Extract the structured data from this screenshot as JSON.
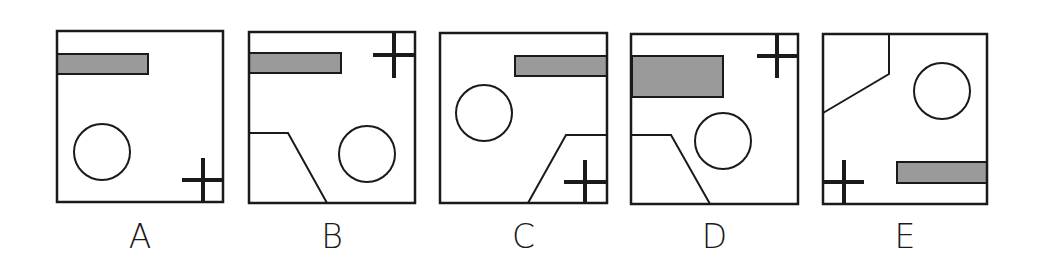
{
  "colors": {
    "stroke": "#1a1a1a",
    "shade": "#9a9a9a",
    "background": "#ffffff"
  },
  "panels": [
    {
      "label": "A",
      "box": {
        "x": 57,
        "y": 31,
        "w": 166,
        "h": 171
      },
      "shaded_rect": {
        "x": 57,
        "y": 54,
        "w": 91,
        "h": 20
      },
      "circle": {
        "cx": 102,
        "cy": 152,
        "r": 28
      },
      "cross": {
        "cx": 203,
        "cy": 180,
        "x1": 182,
        "x2": 223,
        "y1": 158,
        "y2": 202
      },
      "polyline": null
    },
    {
      "label": "B",
      "box": {
        "x": 249,
        "y": 32,
        "w": 166,
        "h": 171
      },
      "shaded_rect": {
        "x": 249,
        "y": 53,
        "w": 92,
        "h": 20
      },
      "circle": {
        "cx": 367,
        "cy": 154,
        "r": 28
      },
      "cross": {
        "cx": 394,
        "cy": 55,
        "x1": 373,
        "x2": 415,
        "y1": 32,
        "y2": 78
      },
      "polyline": "249,133 288,133 327,203"
    },
    {
      "label": "C",
      "box": {
        "x": 440,
        "y": 33,
        "w": 167,
        "h": 170
      },
      "shaded_rect": {
        "x": 515,
        "y": 56,
        "w": 92,
        "h": 20
      },
      "circle": {
        "cx": 484,
        "cy": 113,
        "r": 28
      },
      "cross": {
        "cx": 585,
        "cy": 182,
        "x1": 564,
        "x2": 607,
        "y1": 160,
        "y2": 203
      },
      "polyline": "528,203 566,135 607,135"
    },
    {
      "label": "D",
      "box": {
        "x": 631,
        "y": 34,
        "w": 167,
        "h": 170
      },
      "shaded_rect": {
        "x": 632,
        "y": 56,
        "w": 91,
        "h": 41
      },
      "circle": {
        "cx": 723,
        "cy": 141,
        "r": 28
      },
      "cross": {
        "cx": 777,
        "cy": 56,
        "x1": 757,
        "x2": 798,
        "y1": 34,
        "y2": 78
      },
      "polyline": "631,135 671,135 710,204"
    },
    {
      "label": "E",
      "box": {
        "x": 823,
        "y": 34,
        "w": 164,
        "h": 170
      },
      "shaded_rect": {
        "x": 897,
        "y": 162,
        "w": 90,
        "h": 21
      },
      "circle": {
        "cx": 942,
        "cy": 91,
        "r": 28
      },
      "cross": {
        "cx": 844,
        "cy": 182,
        "x1": 823,
        "x2": 864,
        "y1": 160,
        "y2": 204
      },
      "polyline": "889,34 889,74 823,113"
    }
  ],
  "label_y": 248
}
